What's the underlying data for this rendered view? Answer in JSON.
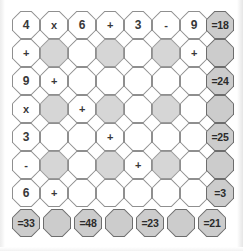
{
  "puzzle": {
    "title": "Arithmetic octagon puzzle grid",
    "geometry": {
      "origin_x": 12,
      "origin_y": 11,
      "cell_size": 28,
      "step_x": 28,
      "step_y": 28,
      "results_column_x": 206,
      "results_row_y": 209,
      "bottom_step_x": 31
    },
    "colors": {
      "background": "#ffffff",
      "cell_white": "#ffffff",
      "cell_shaded": "#d6d6d6",
      "cell_result": "#cccccc",
      "border": "#8e8e8e",
      "border_result": "#6d6d6d",
      "text": "#383838"
    },
    "grid": [
      [
        {
          "text": "4",
          "fill": "white",
          "kind": "num"
        },
        {
          "text": "x",
          "fill": "white",
          "kind": "op"
        },
        {
          "text": "6",
          "fill": "white",
          "kind": "num"
        },
        {
          "text": "+",
          "fill": "white",
          "kind": "op"
        },
        {
          "text": "3",
          "fill": "white",
          "kind": "num"
        },
        {
          "text": "-",
          "fill": "white",
          "kind": "op"
        },
        {
          "text": "9",
          "fill": "white",
          "kind": "num"
        }
      ],
      [
        {
          "text": "+",
          "fill": "white",
          "kind": "op"
        },
        {
          "text": "",
          "fill": "shaded",
          "kind": "blank"
        },
        {
          "text": "",
          "fill": "white",
          "kind": "blank"
        },
        {
          "text": "",
          "fill": "shaded",
          "kind": "blank"
        },
        {
          "text": "",
          "fill": "white",
          "kind": "blank"
        },
        {
          "text": "",
          "fill": "shaded",
          "kind": "blank"
        },
        {
          "text": "+",
          "fill": "white",
          "kind": "op"
        }
      ],
      [
        {
          "text": "9",
          "fill": "white",
          "kind": "num"
        },
        {
          "text": "+",
          "fill": "white",
          "kind": "op"
        },
        {
          "text": "",
          "fill": "white",
          "kind": "blank"
        },
        {
          "text": "",
          "fill": "white",
          "kind": "blank"
        },
        {
          "text": "",
          "fill": "white",
          "kind": "blank"
        },
        {
          "text": "",
          "fill": "white",
          "kind": "blank"
        },
        {
          "text": "",
          "fill": "white",
          "kind": "blank"
        }
      ],
      [
        {
          "text": "x",
          "fill": "white",
          "kind": "op"
        },
        {
          "text": "",
          "fill": "shaded",
          "kind": "blank"
        },
        {
          "text": "+",
          "fill": "white",
          "kind": "op"
        },
        {
          "text": "",
          "fill": "shaded",
          "kind": "blank"
        },
        {
          "text": "",
          "fill": "white",
          "kind": "blank"
        },
        {
          "text": "",
          "fill": "shaded",
          "kind": "blank"
        },
        {
          "text": "",
          "fill": "white",
          "kind": "blank"
        }
      ],
      [
        {
          "text": "3",
          "fill": "white",
          "kind": "num"
        },
        {
          "text": "",
          "fill": "white",
          "kind": "blank"
        },
        {
          "text": "",
          "fill": "white",
          "kind": "blank"
        },
        {
          "text": "+",
          "fill": "white",
          "kind": "op"
        },
        {
          "text": "",
          "fill": "white",
          "kind": "blank"
        },
        {
          "text": "",
          "fill": "white",
          "kind": "blank"
        },
        {
          "text": "",
          "fill": "white",
          "kind": "blank"
        }
      ],
      [
        {
          "text": "-",
          "fill": "white",
          "kind": "op"
        },
        {
          "text": "",
          "fill": "shaded",
          "kind": "blank"
        },
        {
          "text": "",
          "fill": "white",
          "kind": "blank"
        },
        {
          "text": "",
          "fill": "shaded",
          "kind": "blank"
        },
        {
          "text": "+",
          "fill": "white",
          "kind": "op"
        },
        {
          "text": "",
          "fill": "shaded",
          "kind": "blank"
        },
        {
          "text": "",
          "fill": "white",
          "kind": "blank"
        }
      ],
      [
        {
          "text": "6",
          "fill": "white",
          "kind": "num"
        },
        {
          "text": "+",
          "fill": "white",
          "kind": "op"
        },
        {
          "text": "",
          "fill": "white",
          "kind": "blank"
        },
        {
          "text": "",
          "fill": "white",
          "kind": "blank"
        },
        {
          "text": "",
          "fill": "white",
          "kind": "blank"
        },
        {
          "text": "",
          "fill": "white",
          "kind": "blank"
        },
        {
          "text": "",
          "fill": "white",
          "kind": "blank"
        }
      ]
    ],
    "row_results": [
      {
        "text": "=18",
        "fill": "result"
      },
      {
        "text": "",
        "fill": "result"
      },
      {
        "text": "=24",
        "fill": "result"
      },
      {
        "text": "",
        "fill": "result"
      },
      {
        "text": "=25",
        "fill": "result"
      },
      {
        "text": "",
        "fill": "result"
      },
      {
        "text": "=3",
        "fill": "result"
      }
    ],
    "column_results": [
      {
        "text": "=33",
        "fill": "result"
      },
      {
        "text": "",
        "fill": "result"
      },
      {
        "text": "=48",
        "fill": "result"
      },
      {
        "text": "",
        "fill": "result"
      },
      {
        "text": "=23",
        "fill": "result"
      },
      {
        "text": "",
        "fill": "result"
      },
      {
        "text": "=21",
        "fill": "result"
      }
    ]
  }
}
